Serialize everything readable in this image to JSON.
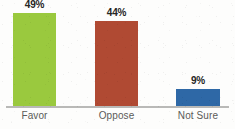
{
  "chart_data": {
    "type": "bar",
    "title": "",
    "subtitle": "",
    "xlabel": "",
    "ylabel": "",
    "ylim": [
      0,
      55
    ],
    "grid": false,
    "legend": "none",
    "categories": [
      "Favor",
      "Oppose",
      "Not Sure"
    ],
    "values": [
      49,
      44,
      9
    ],
    "value_labels": [
      "49%",
      "44%",
      "9%"
    ],
    "units": "percent",
    "bar_colors": [
      "#9ac93e",
      "#b04a33",
      "#2e68a6"
    ],
    "series": [
      {
        "name": "Response share",
        "values": [
          49,
          44,
          9
        ]
      }
    ],
    "points": [
      {
        "category": "Favor",
        "value": 49,
        "label": "49%",
        "color": "#9ac93e"
      },
      {
        "category": "Oppose",
        "value": 44,
        "label": "44%",
        "color": "#b04a33"
      },
      {
        "category": "Not Sure",
        "value": 9,
        "label": "9%",
        "color": "#2e68a6"
      }
    ]
  },
  "axis": {
    "baseline_color": "#b9b9b7"
  },
  "style": {
    "background": "#fdfdfc",
    "value_label_color": "#262524",
    "category_label_color": "#5b5b59"
  }
}
